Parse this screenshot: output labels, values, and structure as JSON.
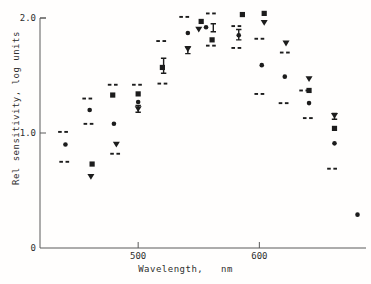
{
  "figure": {
    "background": "#fffefd",
    "ink": "#1c1c1c",
    "axis_color": "#5a5a5a",
    "text_color": "#2e2e2e"
  },
  "chart_data": {
    "type": "scatter",
    "title": "",
    "xlabel": "Wavelength,   nm",
    "ylabel": "Rel sensitivity, log units",
    "xlim": [
      419,
      688
    ],
    "ylim": [
      0,
      2.0
    ],
    "grid": false,
    "legend": "none",
    "x_ticks": [
      {
        "value": 500,
        "label": "500"
      },
      {
        "value": 600,
        "label": "600"
      }
    ],
    "y_ticks": [
      {
        "value": 0,
        "label": "0"
      },
      {
        "value": 1.0,
        "label": "1.0"
      },
      {
        "value": 2.0,
        "label": "2.0"
      }
    ],
    "series": [
      {
        "name": "filled-circle",
        "marker": "circle",
        "points": [
          [
            440,
            0.9
          ],
          [
            460,
            1.2
          ],
          [
            480,
            1.08
          ],
          [
            500,
            1.27
          ],
          [
            541,
            1.87
          ],
          [
            556,
            1.92
          ],
          [
            583,
            1.85
          ],
          [
            602,
            1.59
          ],
          [
            621,
            1.49
          ],
          [
            641,
            1.26
          ],
          [
            662,
            0.91
          ],
          [
            681,
            0.29
          ]
        ]
      },
      {
        "name": "filled-square",
        "marker": "square",
        "points": [
          [
            462,
            0.73
          ],
          [
            479,
            1.33
          ],
          [
            500,
            1.34
          ],
          [
            520,
            1.57
          ],
          [
            552,
            1.97
          ],
          [
            561,
            1.81
          ],
          [
            586,
            2.03
          ],
          [
            604,
            2.04
          ],
          [
            641,
            1.37
          ],
          [
            662,
            1.04
          ]
        ]
      },
      {
        "name": "filled-triangle-down",
        "marker": "triangle-down",
        "points": [
          [
            461,
            0.62
          ],
          [
            482,
            0.9
          ],
          [
            500,
            1.21
          ],
          [
            541,
            1.73
          ],
          [
            550,
            1.9
          ],
          [
            604,
            1.96
          ],
          [
            622,
            1.78
          ],
          [
            641,
            1.47
          ],
          [
            662,
            1.15
          ]
        ]
      },
      {
        "name": "dash-pair",
        "marker": "dash-pair",
        "points": [
          [
            438,
            1.01
          ],
          [
            439,
            0.75
          ],
          [
            458,
            1.3
          ],
          [
            459,
            1.08
          ],
          [
            479,
            1.42
          ],
          [
            481,
            0.82
          ],
          [
            499,
            1.42
          ],
          [
            519,
            1.8
          ],
          [
            520,
            1.43
          ],
          [
            538,
            2.01
          ],
          [
            560,
            2.04
          ],
          [
            560,
            1.76
          ],
          [
            581,
            1.93
          ],
          [
            581,
            1.74
          ],
          [
            600,
            1.82
          ],
          [
            600,
            1.34
          ],
          [
            621,
            1.7
          ],
          [
            620,
            1.26
          ],
          [
            637,
            1.37
          ],
          [
            640,
            1.13
          ],
          [
            660,
            0.69
          ]
        ]
      }
    ],
    "error_bars": [
      {
        "x": 500,
        "y_low": 1.18,
        "y_high": 1.24
      },
      {
        "x": 521,
        "y_low": 1.52,
        "y_high": 1.65
      },
      {
        "x": 541,
        "y_low": 1.69,
        "y_high": 1.75
      },
      {
        "x": 562,
        "y_low": 1.88,
        "y_high": 1.95
      },
      {
        "x": 583,
        "y_low": 1.81,
        "y_high": 1.9
      },
      {
        "x": 662,
        "y_low": 1.12,
        "y_high": 1.17
      }
    ]
  }
}
